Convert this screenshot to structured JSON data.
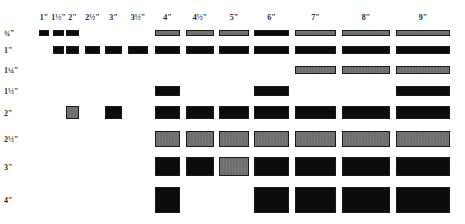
{
  "diagram": {
    "columns": [
      {
        "key": "c1",
        "label": "1\"",
        "x": 39,
        "w": 10
      },
      {
        "key": "c1h",
        "label": "1½\"",
        "x": 53,
        "w": 11
      },
      {
        "key": "c2",
        "label": "2\"",
        "x": 66,
        "w": 13
      },
      {
        "key": "c2h",
        "label": "2½\"",
        "x": 85,
        "w": 15
      },
      {
        "key": "c3",
        "label": "3\"",
        "x": 105,
        "w": 17
      },
      {
        "key": "c3h",
        "label": "3½\"",
        "x": 128,
        "w": 20
      },
      {
        "key": "c4",
        "label": "4\"",
        "x": 155,
        "w": 25
      },
      {
        "key": "c4h",
        "label": "4½\"",
        "x": 186,
        "w": 28
      },
      {
        "key": "c5",
        "label": "5\"",
        "x": 219,
        "w": 30
      },
      {
        "key": "c6",
        "label": "6\"",
        "x": 254,
        "w": 35
      },
      {
        "key": "c7",
        "label": "7\"",
        "x": 295,
        "w": 41
      },
      {
        "key": "c8",
        "label": "8\"",
        "x": 342,
        "w": 48
      },
      {
        "key": "c9",
        "label": "9\"",
        "x": 396,
        "w": 54
      }
    ],
    "rows": [
      {
        "label": "¾\"",
        "y": 30,
        "h": 6,
        "cells": {
          "c1": "dark",
          "c1h": "dark",
          "c2": "dark",
          "c4": "gray",
          "c4h": "gray",
          "c5": "gray",
          "c6": "dark",
          "c7": "gray",
          "c8": "gray",
          "c9": "gray"
        }
      },
      {
        "label": "1\"",
        "y": 46,
        "h": 8,
        "cells": {
          "c1h": "dark",
          "c2": "dark",
          "c2h": "dark",
          "c3": "dark",
          "c3h": "dark",
          "c4": "dark",
          "c4h": "dark",
          "c5": "dark",
          "c6": "dark",
          "c7": "dark",
          "c8": "dark",
          "c9": "dark"
        }
      },
      {
        "label": "1¼\"",
        "y": 66,
        "h": 8,
        "cells": {
          "c7": "gray",
          "c8": "gray",
          "c9": "gray"
        }
      },
      {
        "label": "1½\"",
        "y": 86,
        "h": 10,
        "cells": {
          "c4": "dark",
          "c6": "dark",
          "c9": "dark"
        }
      },
      {
        "label": "2\"",
        "y": 106,
        "h": 13,
        "cells": {
          "c2": "gray",
          "c3": "dark",
          "c4": "dark",
          "c4h": "dark",
          "c5": "dark",
          "c6": "dark",
          "c7": "dark",
          "c8": "dark",
          "c9": "dark"
        }
      },
      {
        "label": "2½\"",
        "y": 131,
        "h": 16,
        "cells": {
          "c4": "gray",
          "c4h": "gray",
          "c5": "gray",
          "c6": "gray",
          "c7": "gray",
          "c8": "gray",
          "c9": "gray"
        }
      },
      {
        "label": "3\"",
        "y": 157,
        "h": 19,
        "cells": {
          "c4": "dark",
          "c4h": "dark",
          "c5": "gray",
          "c6": "dark",
          "c7": "dark",
          "c8": "dark",
          "c9": "dark"
        }
      },
      {
        "label": "4\"",
        "y": 187,
        "h": 26,
        "cells": {
          "c4": "dark",
          "c6": "dark",
          "c7": "dark",
          "c8": "dark",
          "c9": "dark"
        }
      }
    ],
    "colors": {
      "dark": "#0c0c0c",
      "gray": "#6d6d6d",
      "background": "#ffffff",
      "label": "#2a2a2a"
    }
  }
}
